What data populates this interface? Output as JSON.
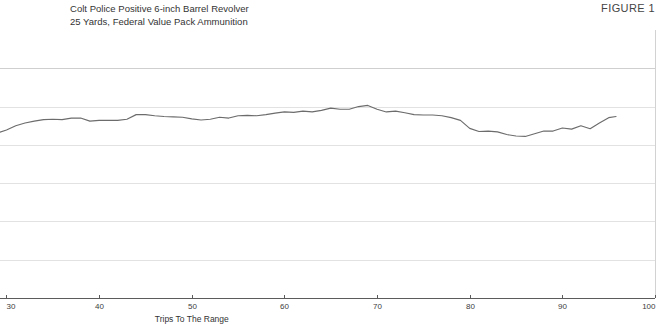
{
  "header": {
    "title_lines": [
      "Colt Police Positive 6-inch Barrel Revolver",
      "25 Yards, Federal Value Pack Ammunition"
    ],
    "figure_label": "FIGURE 1"
  },
  "chart_data": {
    "type": "line",
    "title": "Colt Police Positive 6-inch Barrel Revolver",
    "subtitle": "25 Yards, Federal Value Pack Ammunition",
    "xlabel": "Trips To The Range",
    "ylabel": "",
    "xlim": [
      29.3,
      100
    ],
    "ylim": [
      0,
      7
    ],
    "xticks": [
      30,
      40,
      50,
      60,
      70,
      80,
      90,
      100
    ],
    "xtick_labels": [
      "30",
      "40",
      "50",
      "60",
      "70",
      "80",
      "90",
      "100"
    ],
    "yticks": [
      0,
      1,
      2,
      3,
      4,
      5,
      6
    ],
    "ytick_labels": [],
    "grid": "horizontal",
    "legend": "none",
    "series": [
      {
        "name": "Group Size",
        "color": "#6c6c6c",
        "x": [
          29.3,
          30.0,
          31.0,
          32.0,
          33.0,
          34.0,
          35.0,
          36.0,
          37.0,
          38.0,
          39.0,
          40.0,
          41.0,
          42.0,
          43.0,
          44.0,
          45.0,
          46.0,
          47.0,
          48.0,
          49.0,
          50.0,
          51.0,
          52.0,
          53.0,
          54.0,
          55.0,
          56.0,
          57.0,
          58.0,
          59.0,
          60.0,
          61.0,
          62.0,
          63.0,
          64.0,
          65.0,
          66.0,
          67.0,
          68.0,
          69.0,
          70.0,
          71.0,
          72.0,
          73.0,
          74.0,
          75.0,
          76.0,
          77.0,
          78.0,
          79.0,
          80.0,
          81.0,
          82.0,
          83.0,
          84.0,
          85.0,
          86.0,
          87.0,
          88.0,
          89.0,
          90.0,
          91.0,
          92.0,
          93.0,
          94.0,
          95.0,
          95.8
        ],
        "y": [
          4.33,
          4.39,
          4.5,
          4.57,
          4.62,
          4.66,
          4.67,
          4.66,
          4.7,
          4.7,
          4.62,
          4.64,
          4.64,
          4.64,
          4.67,
          4.79,
          4.79,
          4.76,
          4.74,
          4.73,
          4.72,
          4.68,
          4.65,
          4.67,
          4.72,
          4.7,
          4.76,
          4.77,
          4.76,
          4.79,
          4.83,
          4.86,
          4.85,
          4.88,
          4.86,
          4.9,
          4.96,
          4.93,
          4.93,
          5.0,
          5.03,
          4.93,
          4.86,
          4.88,
          4.84,
          4.79,
          4.78,
          4.78,
          4.76,
          4.71,
          4.64,
          4.43,
          4.35,
          4.36,
          4.34,
          4.27,
          4.23,
          4.22,
          4.29,
          4.36,
          4.36,
          4.44,
          4.41,
          4.5,
          4.42,
          4.57,
          4.71,
          4.74
        ]
      }
    ]
  }
}
